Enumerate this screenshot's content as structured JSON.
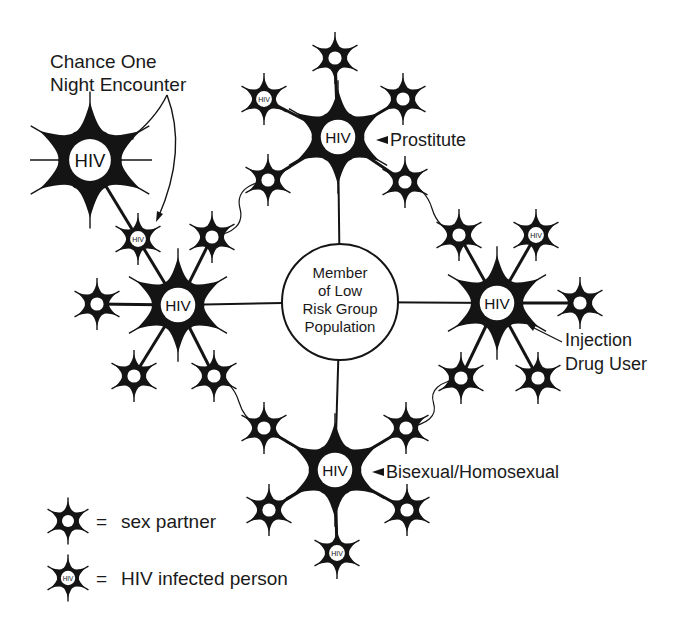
{
  "diagram": {
    "ink": "#141414",
    "paper": "#ffffff",
    "center": {
      "x": 340,
      "y": 302,
      "r": 58,
      "lines": [
        "Member",
        "of Low",
        "Risk Group",
        "Population"
      ]
    },
    "hubs": [
      {
        "id": "prostitute",
        "x": 338,
        "y": 137,
        "label": "Prostitute",
        "lx": 390,
        "ly": 146,
        "pointer": "left-arrow"
      },
      {
        "id": "injection-drug-user",
        "x": 497,
        "y": 303,
        "label_lines": [
          "Injection",
          "Drug User"
        ],
        "lx": 565,
        "ly": 346
      },
      {
        "id": "bisexual-homosexual",
        "x": 335,
        "y": 470,
        "label": "Bisexual/Homosexual",
        "lx": 386,
        "ly": 478,
        "pointer": "left-arrow"
      },
      {
        "id": "left-hub",
        "x": 178,
        "y": 305
      },
      {
        "id": "chance-encounter",
        "x": 90,
        "y": 160
      }
    ],
    "chance_label": [
      "Chance One",
      "Night Encounter"
    ],
    "partners": [
      {
        "x": 335,
        "y": 58,
        "hiv": false
      },
      {
        "x": 264,
        "y": 99,
        "hiv": true
      },
      {
        "x": 403,
        "y": 99,
        "hiv": false
      },
      {
        "x": 268,
        "y": 180,
        "hiv": false
      },
      {
        "x": 405,
        "y": 182,
        "hiv": false
      },
      {
        "x": 138,
        "y": 239,
        "hiv": true
      },
      {
        "x": 212,
        "y": 237,
        "hiv": false
      },
      {
        "x": 97,
        "y": 304,
        "hiv": false
      },
      {
        "x": 134,
        "y": 376,
        "hiv": false
      },
      {
        "x": 214,
        "y": 376,
        "hiv": false
      },
      {
        "x": 459,
        "y": 235,
        "hiv": false
      },
      {
        "x": 536,
        "y": 235,
        "hiv": true
      },
      {
        "x": 580,
        "y": 303,
        "hiv": false
      },
      {
        "x": 461,
        "y": 378,
        "hiv": false
      },
      {
        "x": 538,
        "y": 378,
        "hiv": false
      },
      {
        "x": 264,
        "y": 428,
        "hiv": false
      },
      {
        "x": 406,
        "y": 428,
        "hiv": false
      },
      {
        "x": 269,
        "y": 510,
        "hiv": false
      },
      {
        "x": 407,
        "y": 510,
        "hiv": false
      },
      {
        "x": 337,
        "y": 553,
        "hiv": true
      }
    ],
    "hiv_text": "HIV"
  },
  "legend": {
    "items": [
      {
        "symbol": "sex-partner",
        "eq": "=",
        "label": "sex partner",
        "x": 68,
        "y": 521
      },
      {
        "symbol": "hiv-infected",
        "eq": "=",
        "label": "HIV infected person",
        "x": 68,
        "y": 578
      }
    ]
  }
}
